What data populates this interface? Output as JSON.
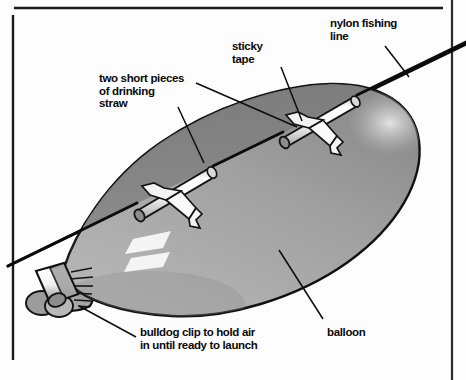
{
  "figure": {
    "type": "labelled-science-diagram",
    "background_color": "#fdfdfd",
    "frame": {
      "stroke_color": "#1a1a1a",
      "top_rule": true,
      "left_rule": true,
      "right_rule": true
    },
    "labels": [
      {
        "id": "nylon",
        "text": "nylon fishing\nline",
        "leader_from": [
          384,
          46
        ],
        "leader_to": [
          409,
          76
        ]
      },
      {
        "id": "sticky",
        "text": "sticky\ntape",
        "leader_from": [
          283,
          66
        ],
        "leader_to": [
          303,
          120
        ]
      },
      {
        "id": "straw",
        "text": "two short pieces\nof drinking\nstraw",
        "leader_from": [
          196,
          82
        ],
        "leader_to": [
          297,
          128
        ],
        "leader2_from": [
          179,
          106
        ],
        "leader2_to": [
          204,
          162
        ]
      },
      {
        "id": "balloon",
        "text": "balloon",
        "leader_from": [
          324,
          318
        ],
        "leader_to": [
          279,
          249
        ]
      },
      {
        "id": "bulldog",
        "text": "bulldog clip to hold air\nin until ready to launch",
        "leader_from": [
          136,
          336
        ],
        "leader_to": [
          78,
          305
        ]
      }
    ],
    "parts": {
      "balloon": {
        "name": "balloon",
        "fill_light": "#a9a9a9",
        "fill_dark": "#8a8a8a",
        "top_band": "#7e7e7e",
        "outline": "#111111",
        "highlight_color": "#f2f2f2"
      },
      "straws": {
        "name": "two short pieces of drinking straw",
        "count": 2,
        "fill": "#f4f4f4",
        "shade": "#b6b6b6",
        "outline": "#141414"
      },
      "tape": {
        "name": "sticky tape",
        "count": 2,
        "fill": "#fafafa",
        "outline": "#141414"
      },
      "line": {
        "name": "nylon fishing line",
        "color": "#0c0c0c",
        "left_edge_y": 262,
        "right_edge_y": 48
      },
      "clip": {
        "name": "bulldog clip",
        "fill": "#ededed",
        "shade": "#8f8f8f",
        "outline": "#121212"
      }
    }
  }
}
